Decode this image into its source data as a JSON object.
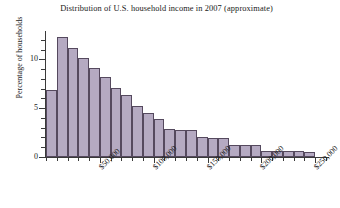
{
  "chart_data": {
    "type": "bar",
    "title": "Distribution of U.S. household income in 2007 (approximate)",
    "xlabel": "",
    "ylabel": "Percentage of households",
    "ylim": [
      0,
      12.8
    ],
    "xlim": [
      0,
      260000
    ],
    "grid": false,
    "legend": null,
    "bin_width": 10000,
    "categories": [
      "$0–$10,000",
      "$10,000–$20,000",
      "$20,000–$30,000",
      "$30,000–$40,000",
      "$40,000–$50,000",
      "$50,000–$60,000",
      "$60,000–$70,000",
      "$70,000–$80,000",
      "$80,000–$90,000",
      "$90,000–$100,000",
      "$100,000–$110,000",
      "$110,000–$120,000",
      "$120,000–$130,000",
      "$130,000–$140,000",
      "$140,000–$150,000",
      "$150,000–$160,000",
      "$160,000–$170,000",
      "$170,000–$180,000",
      "$180,000–$190,000",
      "$190,000–$200,000",
      "$200,000–$210,000",
      "$210,000–$220,000",
      "$220,000–$230,000",
      "$230,000–$240,000",
      "$240,000–$250,000"
    ],
    "bin_starts": [
      0,
      10000,
      20000,
      30000,
      40000,
      50000,
      60000,
      70000,
      80000,
      90000,
      100000,
      110000,
      120000,
      130000,
      140000,
      150000,
      160000,
      170000,
      180000,
      190000,
      200000,
      210000,
      220000,
      230000,
      240000
    ],
    "values": [
      6.9,
      12.3,
      11.2,
      10.1,
      9.1,
      8.2,
      7.1,
      6.3,
      5.2,
      4.5,
      3.9,
      2.9,
      2.8,
      2.8,
      2.0,
      1.9,
      1.9,
      1.2,
      1.2,
      1.2,
      0.6,
      0.6,
      0.6,
      0.6,
      0.5
    ],
    "y_ticks": [
      0,
      5,
      10
    ],
    "y_ticks_minor": [
      1,
      2,
      3,
      4,
      6,
      7,
      8,
      9,
      11,
      12
    ],
    "x_ticks": [
      50000,
      100000,
      150000,
      200000,
      250000
    ],
    "x_tick_labels": [
      "$50,000",
      "$100,000",
      "$150,000",
      "$200,000",
      "$250,000"
    ],
    "bar_color": "#b5aac2",
    "bar_edge_color": "#55495e",
    "axis_color": "#3a3a3a",
    "background": "#ffffff"
  }
}
